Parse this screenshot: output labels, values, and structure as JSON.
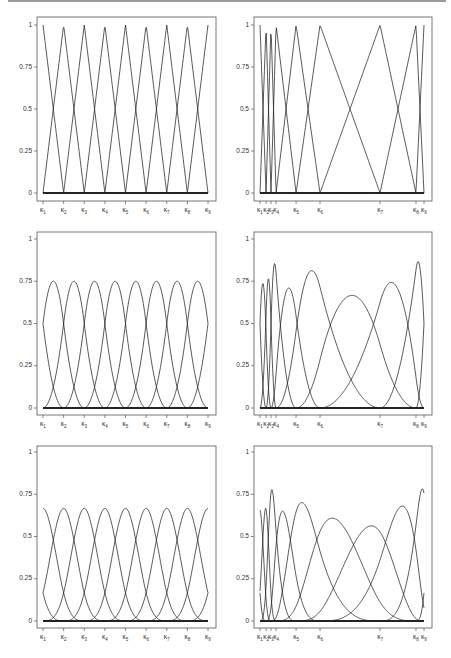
{
  "figure": {
    "layout": "3 rows x 2 columns"
  },
  "chart_data": [
    {
      "type": "line",
      "panel": "row1-left",
      "title": "",
      "degree": 1,
      "knots": [
        0,
        0.125,
        0.25,
        0.375,
        0.5,
        0.625,
        0.75,
        0.875,
        1
      ],
      "x_tick_labels": [
        "κ1",
        "κ2",
        "κ3",
        "κ4",
        "κ5",
        "κ6",
        "κ7",
        "κ8",
        "κ9"
      ],
      "y_ticks": [
        0,
        0.25,
        0.5,
        0.75,
        1
      ],
      "y_tick_labels": [
        "0",
        "0.25",
        "0.5",
        "0.75",
        "1"
      ],
      "ylim": [
        0,
        1
      ],
      "peak_value": 1,
      "n_basis": 9
    },
    {
      "type": "line",
      "panel": "row1-right",
      "degree": 1,
      "knots": [
        0,
        0.037,
        0.067,
        0.098,
        0.22,
        0.366,
        0.732,
        0.951,
        1
      ],
      "x_tick_labels": [
        "κ1",
        "κ2",
        "κ3",
        "κ4",
        "κ5",
        "κ6",
        "κ7",
        "κ8",
        "κ9"
      ],
      "y_ticks": [
        0,
        0.25,
        0.5,
        0.75,
        1
      ],
      "y_tick_labels": [
        "0",
        "0.25",
        "0.5",
        "0.75",
        "1"
      ],
      "ylim": [
        0,
        1
      ],
      "peak_value": 1,
      "n_basis": 9
    },
    {
      "type": "line",
      "panel": "row2-left",
      "degree": 2,
      "knots": [
        0,
        0.125,
        0.25,
        0.375,
        0.5,
        0.625,
        0.75,
        0.875,
        1
      ],
      "x_tick_labels": [
        "κ1",
        "κ2",
        "κ3",
        "κ4",
        "κ5",
        "κ6",
        "κ7",
        "κ8",
        "κ9"
      ],
      "y_ticks": [
        0,
        0.25,
        0.5,
        0.75,
        1
      ],
      "y_tick_labels": [
        "0",
        "0.25",
        "0.5",
        "0.75",
        "1"
      ],
      "ylim": [
        0,
        1
      ],
      "peak_value": 0.75,
      "boundary_value": 0.5
    },
    {
      "type": "line",
      "panel": "row2-right",
      "degree": 2,
      "knots": [
        0,
        0.037,
        0.067,
        0.098,
        0.22,
        0.366,
        0.732,
        0.951,
        1
      ],
      "x_tick_labels": [
        "κ1",
        "κ2",
        "κ3",
        "κ4",
        "κ5",
        "κ6",
        "κ7",
        "κ8",
        "κ9"
      ],
      "y_ticks": [
        0,
        0.25,
        0.5,
        0.75,
        1
      ],
      "y_tick_labels": [
        "0",
        "0.25",
        "0.5",
        "0.75",
        "1"
      ],
      "ylim": [
        0,
        1
      ],
      "approx_peaks": [
        0.74,
        0.7,
        0.73,
        0.87,
        0.7,
        0.81,
        0.66,
        0.74,
        0.86
      ]
    },
    {
      "type": "line",
      "panel": "row3-left",
      "degree": 3,
      "knots": [
        0,
        0.125,
        0.25,
        0.375,
        0.5,
        0.625,
        0.75,
        0.875,
        1
      ],
      "x_tick_labels": [
        "κ1",
        "κ2",
        "κ3",
        "κ4",
        "κ5",
        "κ6",
        "κ7",
        "κ8",
        "κ9"
      ],
      "y_ticks": [
        0,
        0.25,
        0.5,
        0.75,
        1
      ],
      "y_tick_labels": [
        "0",
        "0.25",
        "0.5",
        "0.75",
        "1"
      ],
      "ylim": [
        0,
        1
      ],
      "peak_value": 0.667,
      "boundary_value": 0.167
    },
    {
      "type": "line",
      "panel": "row3-right",
      "degree": 3,
      "knots": [
        0,
        0.037,
        0.067,
        0.098,
        0.22,
        0.366,
        0.732,
        0.951,
        1
      ],
      "x_tick_labels": [
        "κ1",
        "κ2",
        "κ3",
        "κ4",
        "κ5",
        "κ6",
        "κ7",
        "κ8",
        "κ9"
      ],
      "y_ticks": [
        0,
        0.25,
        0.5,
        0.75,
        1
      ],
      "y_tick_labels": [
        "0",
        "0.25",
        "0.5",
        "0.75",
        "1"
      ],
      "ylim": [
        0,
        1
      ],
      "approx_peaks": [
        0.64,
        0.61,
        0.78,
        0.65,
        0.7,
        0.61,
        0.56,
        0.68,
        0.78
      ]
    }
  ],
  "layout_px": {
    "columns": [
      {
        "x0": 37,
        "x1": 216,
        "k0": 43,
        "k1": 208
      },
      {
        "x0": 254,
        "x1": 432,
        "k0": 260,
        "k1": 424
      }
    ],
    "rows": [
      {
        "y0": 17,
        "y1": 201,
        "yOne": 25,
        "yZero": 193
      },
      {
        "y0": 232,
        "y1": 415,
        "yOne": 239,
        "yZero": 408
      },
      {
        "y0": 446,
        "y1": 628,
        "yOne": 452,
        "yZero": 621
      }
    ]
  },
  "colors": {
    "curve": "#222222",
    "axis": "#555555",
    "text": "#333333",
    "top_rule": "#9a9a9a"
  }
}
